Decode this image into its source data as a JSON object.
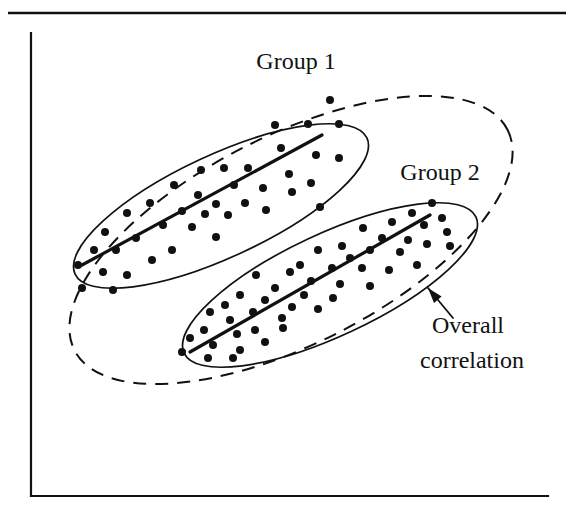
{
  "figure": {
    "background_color": "#ffffff",
    "ink_color": "#111111",
    "width": 571,
    "height": 517
  },
  "rules": {
    "top_rule": {
      "x1": 8,
      "y1": 13,
      "x2": 566,
      "y2": 13,
      "width": 2.6
    }
  },
  "axes": {
    "y_axis": {
      "x1": 31,
      "y1": 33,
      "x2": 31,
      "y2": 496,
      "width": 2.2
    },
    "x_axis": {
      "x1": 31,
      "y1": 496,
      "x2": 548,
      "y2": 496,
      "width": 2.2
    }
  },
  "labels": {
    "group1": {
      "text": "Group 1",
      "x": 296,
      "y": 69,
      "font_size": 24,
      "anchor": "middle"
    },
    "group2": {
      "text": "Group 2",
      "x": 440,
      "y": 180,
      "font_size": 24,
      "anchor": "middle"
    },
    "overall_line1": {
      "text": "Overall",
      "x": 432,
      "y": 333,
      "font_size": 24,
      "anchor": "start"
    },
    "overall_line2": {
      "text": "correlation",
      "x": 420,
      "y": 368,
      "font_size": 24,
      "anchor": "start"
    }
  },
  "annotation_arrow": {
    "name": "overall-correlation-pointer",
    "x1": 453,
    "y1": 318,
    "x2": 428,
    "y2": 288,
    "width": 1.8,
    "head_size": 9
  },
  "ellipses": {
    "overall": {
      "label": "overall-correlation-ellipse",
      "style": "dashed",
      "cx": 291,
      "cy": 240,
      "rx": 243,
      "ry": 104,
      "rotation": -27,
      "stroke_width": 2.0,
      "dash": "13 9"
    },
    "group1": {
      "label": "group1-ellipse",
      "style": "solid",
      "cx": 221,
      "cy": 206,
      "rx": 161,
      "ry": 51,
      "rotation": -25,
      "stroke_width": 1.7
    },
    "group2": {
      "label": "group2-ellipse",
      "style": "solid",
      "cx": 330,
      "cy": 285,
      "rx": 161,
      "ry": 51,
      "rotation": -25,
      "stroke_width": 1.7
    }
  },
  "regression_lines": {
    "group1": {
      "label": "group1-regression-line",
      "x1": 82,
      "y1": 265,
      "x2": 322,
      "y2": 135,
      "width": 3.2
    },
    "group2": {
      "label": "group2-regression-line",
      "x1": 190,
      "y1": 352,
      "x2": 430,
      "y2": 215,
      "width": 3.2
    }
  },
  "chart_data": {
    "type": "scatter",
    "xlabel": "",
    "ylabel": "",
    "grid": false,
    "legend": false,
    "axis_ranges": {
      "x": [
        31,
        548
      ],
      "y": [
        33,
        496
      ]
    },
    "note": "Coordinates are given in screen pixels (origin top-left). Dot radius 4 px.",
    "dot_radius": 4,
    "annotations": [
      {
        "text": "Group 1",
        "points_to": "group1-ellipse"
      },
      {
        "text": "Group 2",
        "points_to": "group2-ellipse"
      },
      {
        "text": "Overall correlation",
        "points_to": "overall-correlation-ellipse"
      }
    ],
    "series": [
      {
        "name": "Group 1",
        "marker": "filled-circle",
        "color": "#111111",
        "trend_line": {
          "x1": 82,
          "y1": 265,
          "x2": 322,
          "y2": 135,
          "slope_sign": "positive"
        },
        "points": [
          [
            330,
            100
          ],
          [
            275,
            125
          ],
          [
            308,
            124
          ],
          [
            339,
            124
          ],
          [
            281,
            148
          ],
          [
            316,
            155
          ],
          [
            339,
            158
          ],
          [
            201,
            170
          ],
          [
            224,
            168
          ],
          [
            248,
            168
          ],
          [
            289,
            174
          ],
          [
            311,
            183
          ],
          [
            234,
            185
          ],
          [
            263,
            188
          ],
          [
            292,
            192
          ],
          [
            320,
            207
          ],
          [
            174,
            185
          ],
          [
            198,
            195
          ],
          [
            216,
            204
          ],
          [
            245,
            203
          ],
          [
            266,
            210
          ],
          [
            150,
            203
          ],
          [
            182,
            211
          ],
          [
            205,
            214
          ],
          [
            228,
            215
          ],
          [
            127,
            213
          ],
          [
            163,
            225
          ],
          [
            192,
            227
          ],
          [
            216,
            237
          ],
          [
            105,
            232
          ],
          [
            136,
            238
          ],
          [
            172,
            250
          ],
          [
            94,
            250
          ],
          [
            116,
            250
          ],
          [
            152,
            260
          ],
          [
            78,
            265
          ],
          [
            103,
            272
          ],
          [
            127,
            275
          ],
          [
            82,
            288
          ],
          [
            113,
            290
          ]
        ]
      },
      {
        "name": "Group 2",
        "marker": "filled-circle",
        "color": "#111111",
        "trend_line": {
          "x1": 190,
          "y1": 352,
          "x2": 430,
          "y2": 215,
          "slope_sign": "positive"
        },
        "points": [
          [
            432,
            203
          ],
          [
            412,
            213
          ],
          [
            442,
            218
          ],
          [
            392,
            222
          ],
          [
            424,
            225
          ],
          [
            447,
            232
          ],
          [
            408,
            240
          ],
          [
            363,
            228
          ],
          [
            382,
            238
          ],
          [
            427,
            244
          ],
          [
            450,
            246
          ],
          [
            342,
            246
          ],
          [
            370,
            250
          ],
          [
            400,
            252
          ],
          [
            318,
            250
          ],
          [
            350,
            258
          ],
          [
            417,
            265
          ],
          [
            300,
            265
          ],
          [
            332,
            268
          ],
          [
            362,
            268
          ],
          [
            389,
            270
          ],
          [
            290,
            272
          ],
          [
            311,
            281
          ],
          [
            340,
            284
          ],
          [
            370,
            286
          ],
          [
            256,
            275
          ],
          [
            275,
            288
          ],
          [
            304,
            295
          ],
          [
            333,
            298
          ],
          [
            240,
            295
          ],
          [
            265,
            300
          ],
          [
            292,
            307
          ],
          [
            318,
            309
          ],
          [
            225,
            305
          ],
          [
            253,
            312
          ],
          [
            282,
            318
          ],
          [
            210,
            312
          ],
          [
            230,
            320
          ],
          [
            255,
            330
          ],
          [
            283,
            328
          ],
          [
            204,
            330
          ],
          [
            237,
            334
          ],
          [
            265,
            342
          ],
          [
            190,
            338
          ],
          [
            213,
            345
          ],
          [
            240,
            350
          ],
          [
            182,
            352
          ],
          [
            208,
            358
          ],
          [
            233,
            358
          ]
        ]
      }
    ]
  }
}
